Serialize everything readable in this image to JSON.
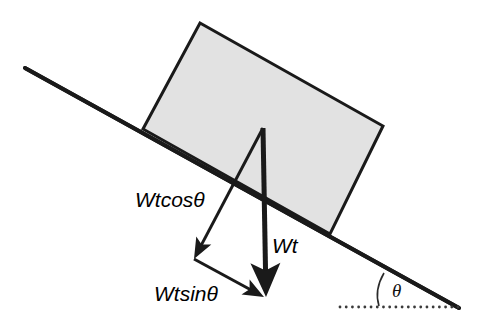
{
  "figure": {
    "background_color": "#ffffff",
    "line_color": "#1a1a1a",
    "block_fill_color": "#e2e2e2",
    "block_stroke_color": "#1a1a1a"
  },
  "incline": {
    "name": "inclined-surface",
    "start": {
      "x": 25,
      "y": 68
    },
    "end": {
      "x": 459,
      "y": 308
    },
    "stroke_width": 4
  },
  "block": {
    "name": "block-on-incline",
    "corners": [
      {
        "x": 200,
        "y": 23
      },
      {
        "x": 383,
        "y": 126
      },
      {
        "x": 330,
        "y": 234
      },
      {
        "x": 143,
        "y": 129
      }
    ],
    "fill": "#e2e2e2",
    "stroke": "#1a1a1a",
    "stroke_width": 3
  },
  "vectors": [
    {
      "name": "weight-vector",
      "label": "Wt",
      "label_x": 272,
      "label_y": 253,
      "from": {
        "x": 263,
        "y": 128
      },
      "to": {
        "x": 266,
        "y": 297
      },
      "stroke_width": 5,
      "head_width": 30,
      "head_length": 34,
      "description": "total weight acting vertically downward"
    },
    {
      "name": "weight-cosine-component-vector",
      "label": "Wtcosθ",
      "label_x": 135,
      "label_y": 207,
      "from": {
        "x": 263,
        "y": 128
      },
      "to": {
        "x": 194,
        "y": 259
      },
      "stroke_width": 3,
      "head_width": 17,
      "head_length": 21,
      "description": "component perpendicular to the inclined surface"
    },
    {
      "name": "weight-sine-component-vector",
      "label": "Wtsinθ",
      "label_x": 154,
      "label_y": 301,
      "from": {
        "x": 194,
        "y": 259
      },
      "to": {
        "x": 264,
        "y": 297
      },
      "stroke_width": 3,
      "head_width": 17,
      "head_length": 21,
      "description": "component parallel to the inclined surface"
    }
  ],
  "angle": {
    "name": "incline-angle",
    "symbol": "θ",
    "label_x": 392,
    "label_y": 297,
    "arc_start": {
      "x": 384,
      "y": 273
    },
    "arc_end": {
      "x": 379,
      "y": 306
    },
    "arc_control": {
      "x": 374,
      "y": 290
    }
  },
  "reference_line": {
    "name": "horizontal-reference-dotted-line",
    "start": {
      "x": 340,
      "y": 307
    },
    "end": {
      "x": 458,
      "y": 307
    },
    "style": "dotted",
    "dot_count": 20,
    "dot_radius": 1.4,
    "color": "#3a3a3a"
  }
}
